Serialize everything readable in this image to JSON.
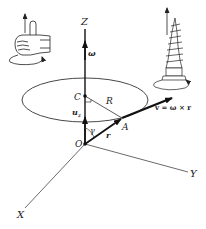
{
  "axes": {
    "x_label": "X",
    "y_label": "Y",
    "z_label": "Z"
  },
  "points": {
    "origin": "O",
    "center": "C",
    "point": "A"
  },
  "vectors": {
    "omega": "ω",
    "unit_z": "u",
    "unit_z_sub": "z",
    "position": "r",
    "velocity_formula": "v = ω × r"
  },
  "labels": {
    "radius": "R",
    "angle": "γ"
  },
  "insets": {
    "left": "right-hand-rule",
    "right": "right-hand-screw"
  },
  "colors": {
    "ink": "#222222",
    "thin": "#444444"
  }
}
